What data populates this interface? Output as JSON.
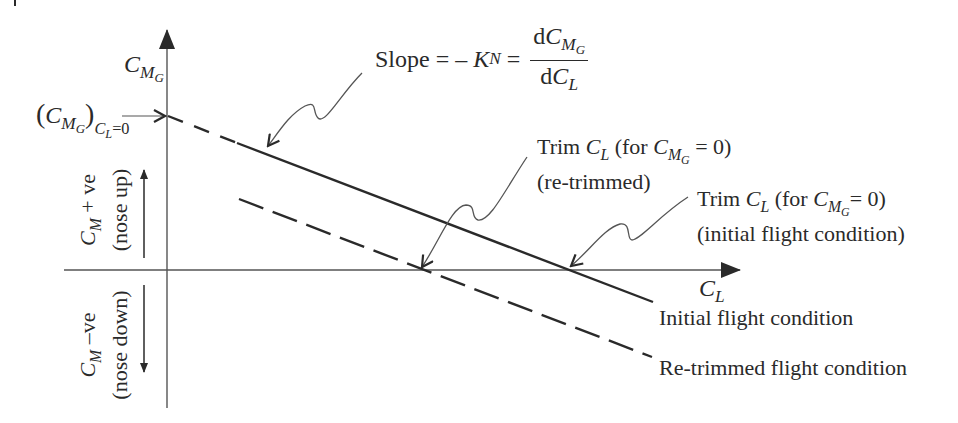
{
  "diagram": {
    "type": "pitching-moment vs lift coefficient trim diagram",
    "colors": {
      "ink": "#2a2a2a",
      "background": "#ffffff"
    },
    "axes": {
      "y_axis": {
        "symbol": "C",
        "sub": "M",
        "subsub": "G"
      },
      "x_axis": {
        "symbol": "C",
        "sub": "L"
      }
    },
    "intercept_label": {
      "open": "(",
      "symbol": "C",
      "sub": "M",
      "subsub": "G",
      "close": ")",
      "condition_symbol": "C",
      "condition_sub": "L",
      "condition_eq": "=0"
    },
    "slope_label": {
      "prefix": "Slope = – ",
      "k": "K",
      "k_sub": "N",
      "equals": " = ",
      "num_d": "d",
      "num_symbol": "C",
      "num_sub": "M",
      "num_subsub": "G",
      "den_d": "d",
      "den_symbol": "C",
      "den_sub": "L"
    },
    "trim_retrimmed_label": {
      "line1_prefix": "Trim ",
      "symbol": "C",
      "sub": "L",
      "for_text": " (for ",
      "cond_symbol": "C",
      "cond_sub": "M",
      "cond_subsub": "G",
      "cond_tail": " = 0)",
      "line2": "(re-trimmed)"
    },
    "trim_initial_label": {
      "line1_prefix": "Trim ",
      "symbol": "C",
      "sub": "L",
      "for_text": " (for ",
      "cond_symbol": "C",
      "cond_sub": "M",
      "cond_subsub": "G",
      "cond_tail": "= 0)",
      "line2": "(initial flight condition)"
    },
    "positive_region": {
      "symbol": "C",
      "sub": "M",
      "text": " + ve",
      "note": "(nose up)"
    },
    "negative_region": {
      "symbol": "C",
      "sub": "M",
      "text": " –ve",
      "note": "(nose down)"
    },
    "legend": {
      "initial": "Initial flight condition",
      "retrimmed": "Re-trimmed flight condition"
    }
  }
}
